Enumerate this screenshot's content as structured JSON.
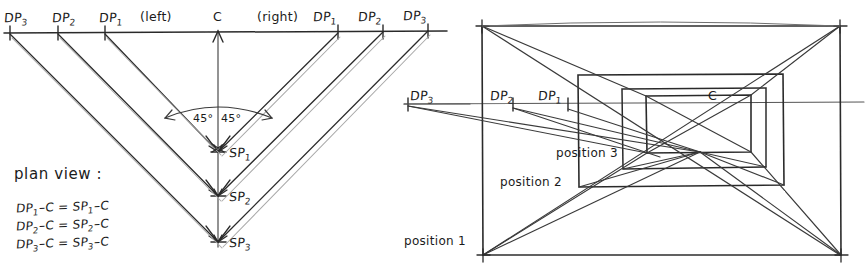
{
  "figure": {
    "title_plan": "plan view :",
    "background": "#ffffff",
    "ink": "#232323",
    "light_ink": "#8a8a8a"
  },
  "plan_view": {
    "heading": "plan view :",
    "horizon_labels_left": [
      {
        "key": "dp3l",
        "base": "DP",
        "sub": "3",
        "x": 10,
        "y": 28
      },
      {
        "key": "dp2l",
        "base": "DP",
        "sub": "2",
        "x": 58,
        "y": 28
      },
      {
        "key": "dp1l",
        "base": "DP",
        "sub": "1",
        "x": 105,
        "y": 28
      }
    ],
    "horizon_labels_right": [
      {
        "key": "dp1r",
        "base": "DP",
        "sub": "1",
        "x": 338,
        "y": 28
      },
      {
        "key": "dp2r",
        "base": "DP",
        "sub": "2",
        "x": 383,
        "y": 28
      },
      {
        "key": "dp3r",
        "base": "DP",
        "sub": "3",
        "x": 428,
        "y": 28
      }
    ],
    "side_left": "(left)",
    "side_right": "(right)",
    "center_label": "C",
    "station_points": [
      {
        "key": "sp1",
        "base": "SP",
        "sub": "1",
        "x": 218,
        "y": 152
      },
      {
        "key": "sp2",
        "base": "SP",
        "sub": "2",
        "x": 218,
        "y": 196
      },
      {
        "key": "sp3",
        "base": "SP",
        "sub": "3",
        "x": 218,
        "y": 242
      }
    ],
    "angles": {
      "left": "45°",
      "right": "45°"
    },
    "equations": [
      {
        "lhs_base": "DP",
        "lhs_sub": "1",
        "lhs_tail": "-C",
        "eq": "=",
        "rhs_base": "SP",
        "rhs_sub": "1",
        "rhs_tail": "-C"
      },
      {
        "lhs_base": "DP",
        "lhs_sub": "2",
        "lhs_tail": "-C",
        "eq": "=",
        "rhs_base": "SP",
        "rhs_sub": "2",
        "rhs_tail": "-C"
      },
      {
        "lhs_base": "DP",
        "lhs_sub": "3",
        "lhs_tail": "-C",
        "eq": "=",
        "rhs_base": "SP",
        "rhs_sub": "3",
        "rhs_tail": "-C"
      }
    ]
  },
  "perspective_view": {
    "horizon_labels": [
      {
        "key": "dp3",
        "base": "DP",
        "sub": "3",
        "x": 412,
        "y": 98
      },
      {
        "key": "dp2",
        "base": "DP",
        "sub": "2",
        "x": 492,
        "y": 98
      },
      {
        "key": "dp1",
        "base": "DP",
        "sub": "1",
        "x": 540,
        "y": 98
      }
    ],
    "center_label": "C",
    "positions": [
      {
        "key": "position1",
        "label": "position 1",
        "x": 404,
        "y": 240
      },
      {
        "key": "position2",
        "label": "position 2",
        "x": 498,
        "y": 181
      },
      {
        "key": "position3",
        "label": "position 3",
        "x": 504,
        "y": 153
      }
    ]
  }
}
